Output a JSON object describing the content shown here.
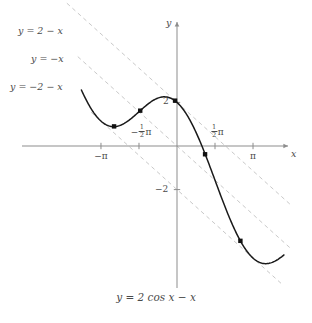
{
  "figure": {
    "caption": "y = 2 cos x − x",
    "axes": {
      "x_label": "x",
      "y_label": "y",
      "origin_px": [
        177,
        146
      ],
      "x_scale_px_per_unit": 24.2,
      "y_scale_px_per_unit": 21.8,
      "xlim": [
        -4.6,
        4.8
      ],
      "ylim": [
        -6.6,
        5.7
      ],
      "grid": false
    },
    "x_ticks": [
      {
        "label": "−π",
        "value": -3.14159,
        "show_minus": true,
        "fraction": null,
        "symbol": "π"
      },
      {
        "label": "−½π",
        "value": -1.5708,
        "show_minus": true,
        "fraction": [
          "1",
          "2"
        ],
        "symbol": "π"
      },
      {
        "label": "½π",
        "value": 1.5708,
        "show_minus": false,
        "fraction": [
          "1",
          "2"
        ],
        "symbol": "π"
      },
      {
        "label": "π",
        "value": 3.14159,
        "show_minus": false,
        "fraction": null,
        "symbol": "π"
      }
    ],
    "y_ticks": [
      {
        "label": "2",
        "value": 2
      },
      {
        "label": "−2",
        "value": -2
      }
    ],
    "line_labels": [
      {
        "text": "y = 2 − x",
        "x_px": 18,
        "y_px": 26
      },
      {
        "text": "y = −x",
        "x_px": 31,
        "y_px": 54
      },
      {
        "text": "y = −2 − x",
        "x_px": 10,
        "y_px": 82
      }
    ]
  },
  "chart_data": {
    "type": "line",
    "xlabel": "x",
    "ylabel": "y",
    "xlim": [
      -4.6,
      4.8
    ],
    "ylim": [
      -6.6,
      5.7
    ],
    "grid": false,
    "legend_position": "upper-left-inline",
    "series": [
      {
        "name": "y = 2 cos x − x",
        "style": "solid",
        "color": "#1a1a1a",
        "formula": "2*cos(x) - x",
        "x_domain": [
          -3.95,
          4.42
        ],
        "points": [
          {
            "x": -3.95,
            "y": 2.6
          },
          {
            "x": -3.5,
            "y": 1.63
          },
          {
            "x": -3.14,
            "y": 1.14
          },
          {
            "x": -2.8,
            "y": 0.92
          },
          {
            "x": -2.5,
            "y": 0.9
          },
          {
            "x": -2.09,
            "y": 1.09
          },
          {
            "x": -1.57,
            "y": 1.57
          },
          {
            "x": -1.05,
            "y": 2.05
          },
          {
            "x": -0.52,
            "y": 2.25
          },
          {
            "x": 0.0,
            "y": 2.0
          },
          {
            "x": 0.52,
            "y": 1.21
          },
          {
            "x": 1.05,
            "y": -0.05
          },
          {
            "x": 1.57,
            "y": -1.57
          },
          {
            "x": 2.09,
            "y": -3.09
          },
          {
            "x": 2.62,
            "y": -4.35
          },
          {
            "x": 3.14,
            "y": -5.14
          },
          {
            "x": 3.67,
            "y": -5.38
          },
          {
            "x": 4.0,
            "y": -5.31
          },
          {
            "x": 4.42,
            "y": -4.99
          }
        ]
      },
      {
        "name": "y = 2 − x",
        "style": "dashed",
        "color": "#c9c9c9",
        "formula": "2 - x",
        "x_domain": [
          -4.55,
          4.75
        ]
      },
      {
        "name": "y = −x",
        "style": "dashed",
        "color": "#c9c9c9",
        "formula": "-x",
        "x_domain": [
          -4.1,
          4.75
        ]
      },
      {
        "name": "y = −2 − x",
        "style": "dashed",
        "color": "#c9c9c9",
        "formula": "-2 - x",
        "x_domain": [
          -3.55,
          4.35
        ]
      }
    ],
    "tangency_points": [
      {
        "x": -2.6,
        "y": 0.9,
        "on_line": "y = −2 − x"
      },
      {
        "x": -1.52,
        "y": 1.62,
        "on_line": "y = −x"
      },
      {
        "x": -0.08,
        "y": 2.08,
        "on_line": "y = 2 − x"
      },
      {
        "x": 1.16,
        "y": -0.38,
        "on_line": "y = −x"
      },
      {
        "x": 2.62,
        "y": -4.35,
        "on_line": "y = −2 − x"
      }
    ]
  }
}
